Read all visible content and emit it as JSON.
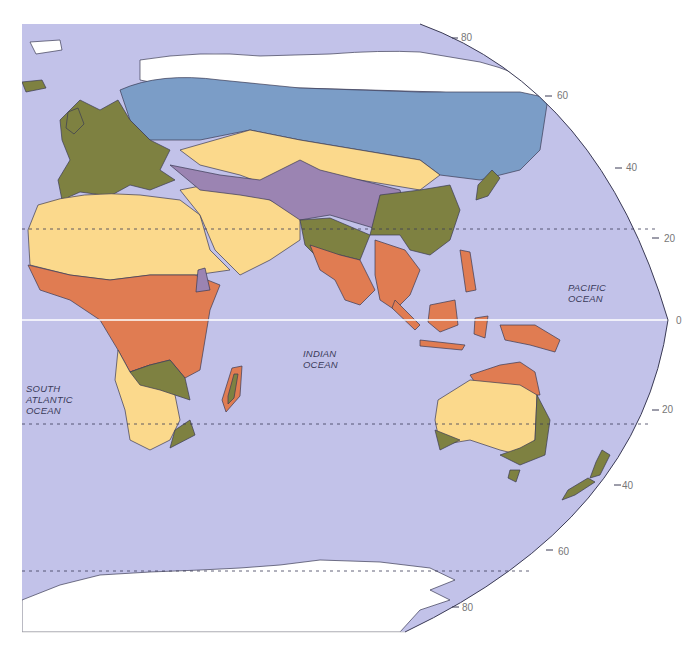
{
  "map": {
    "title": "",
    "projection": "elliptical (Eastern Hemisphere)",
    "colors": {
      "ocean": "#c2c2e9",
      "ice": "#ffffff",
      "boreal": "#7b9dc7",
      "desert": "#fbd98c",
      "temperate": "#7e8141",
      "tropical": "#e07c52",
      "highland": "#9b84b2",
      "outline": "#3b3b55",
      "equator": "#ffffff",
      "tropic_line": "#3b3b55"
    },
    "ocean_labels": [
      {
        "id": "pacific",
        "lines": [
          "PACIFIC",
          "OCEAN"
        ]
      },
      {
        "id": "indian",
        "lines": [
          "INDIAN",
          "OCEAN"
        ]
      },
      {
        "id": "south-atlantic",
        "lines": [
          "SOUTH",
          "ATLANTIC",
          "OCEAN"
        ]
      }
    ],
    "latitude_labels": {
      "n80": "80",
      "n60": "60",
      "n40": "40",
      "n20": "20",
      "eq": "0",
      "s20": "20",
      "s40": "40",
      "s60": "60",
      "s80": "80"
    },
    "legend_regions": [
      "boreal",
      "desert",
      "temperate",
      "tropical",
      "highland",
      "ice"
    ]
  }
}
